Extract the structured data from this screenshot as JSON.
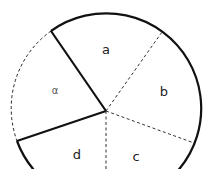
{
  "diagram": {
    "type": "circle-sectors",
    "center": {
      "x": 106,
      "y": 111
    },
    "radius": 95,
    "colors": {
      "stroke": "#111111",
      "label": "#222222",
      "faint_label": "#555555",
      "background": "#ffffff"
    },
    "solid_radii": [
      {
        "name": "radius-upper-left",
        "x2": 51,
        "y2": 31
      },
      {
        "name": "radius-lower-left",
        "x2": 17,
        "y2": 141
      }
    ],
    "dashed_radii": [
      {
        "name": "radius-a-b",
        "x2": 162,
        "y2": 32
      },
      {
        "name": "radius-b-c",
        "x2": 194,
        "y2": 143
      },
      {
        "name": "radius-c-d",
        "x2": 106,
        "y2": 169
      }
    ],
    "labels": {
      "a": "a",
      "b": "b",
      "c": "c",
      "d": "d",
      "left_sector": "α"
    }
  }
}
